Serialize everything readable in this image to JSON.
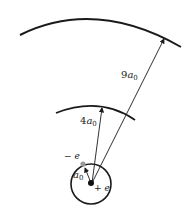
{
  "diagram": {
    "nucleus": {
      "charge_label": "+ e"
    },
    "electron": {
      "charge_label": "− e"
    },
    "orbits": [
      {
        "coef": "",
        "label_sym": "a",
        "label_sub": "0"
      },
      {
        "coef": "4",
        "label_sym": "a",
        "label_sub": "0"
      },
      {
        "coef": "9",
        "label_sym": "a",
        "label_sub": "0"
      }
    ],
    "colors": {
      "line": "#1a1a1a",
      "electron": "#999999"
    }
  }
}
